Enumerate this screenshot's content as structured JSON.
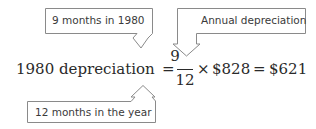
{
  "callouts": {
    "months_1980": {
      "label": "9 months in 1980"
    },
    "annual_depreciation": {
      "label": "Annual depreciation"
    },
    "months_year": {
      "label": "12 months in the year"
    }
  },
  "equation": {
    "lhs": "1980 depreciation",
    "equals_1": "=",
    "fraction": {
      "numerator": "9",
      "denominator": "12"
    },
    "times": "×",
    "annual_amount": "$828",
    "equals_2": "=",
    "result": "$621"
  },
  "colors": {
    "outline": "#8a8a8a",
    "text": "#2a2a2a"
  }
}
